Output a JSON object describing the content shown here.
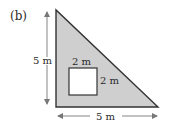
{
  "figure": {
    "panel_label": "(b)",
    "shape": "right-triangle",
    "fill_color": "#cfcfcf",
    "stroke_color": "#333333",
    "hole": {
      "shape": "square",
      "fill_color": "#ffffff",
      "width_label": "2 m",
      "height_label": "2 m"
    },
    "dimensions": {
      "height_label": "5 m",
      "base_label": "5 m"
    }
  }
}
